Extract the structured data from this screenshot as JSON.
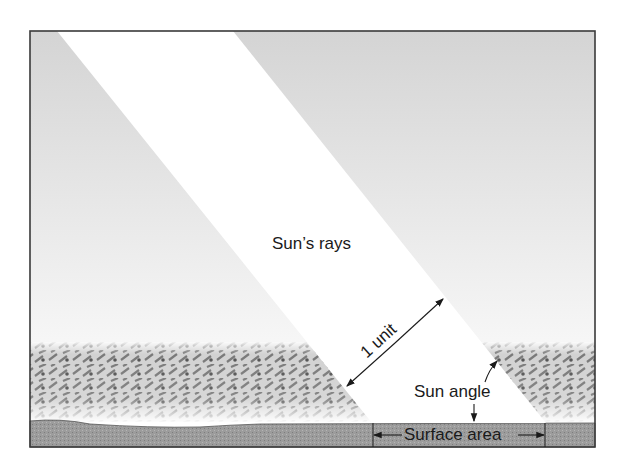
{
  "diagram": {
    "labels": {
      "rays": "Sun’s rays",
      "unit": "1 unit",
      "angle": "Sun angle",
      "area": "Surface area"
    },
    "colors": {
      "frame": "#3a3a3a",
      "sky_top": "#d6d6d6",
      "sky_bottom": "#ffffff",
      "beam": "#ffffff",
      "vegetation": "#8a8a8a",
      "ground": "#9a9a9a",
      "arrow": "#1a1a1a"
    }
  }
}
